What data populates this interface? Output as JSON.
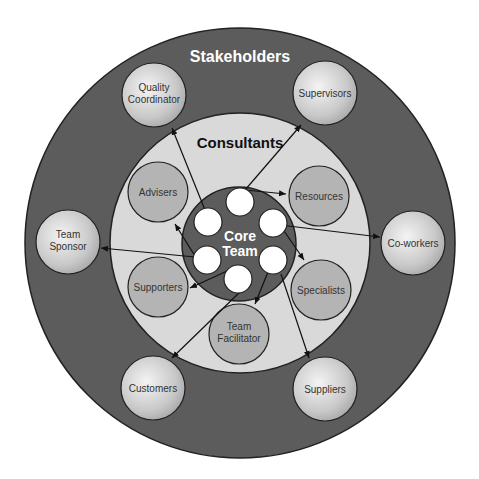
{
  "diagram": {
    "outer_ring": {
      "label": "Stakeholders",
      "color": "#5a5a5a"
    },
    "middle_ring": {
      "label": "Consultants",
      "color": "#d8d8d8"
    },
    "core": {
      "label_line1": "Core",
      "label_line2": "Team",
      "color": "#5a5a5a",
      "member_count": 6
    },
    "stakeholders": [
      {
        "id": "quality-coordinator",
        "line1": "Quality",
        "line2": "Coordinator"
      },
      {
        "id": "supervisors",
        "line1": "Supervisors",
        "line2": ""
      },
      {
        "id": "team-sponsor",
        "line1": "Team",
        "line2": "Sponsor"
      },
      {
        "id": "co-workers",
        "line1": "Co-workers",
        "line2": ""
      },
      {
        "id": "customers",
        "line1": "Customers",
        "line2": ""
      },
      {
        "id": "suppliers",
        "line1": "Suppliers",
        "line2": ""
      }
    ],
    "consultants": [
      {
        "id": "advisers",
        "line1": "Advisers",
        "line2": ""
      },
      {
        "id": "resources",
        "line1": "Resources",
        "line2": ""
      },
      {
        "id": "supporters",
        "line1": "Supporters",
        "line2": ""
      },
      {
        "id": "specialists",
        "line1": "Specialists",
        "line2": ""
      },
      {
        "id": "team-facilitator",
        "line1": "Team",
        "line2": "Facilitator"
      }
    ]
  }
}
